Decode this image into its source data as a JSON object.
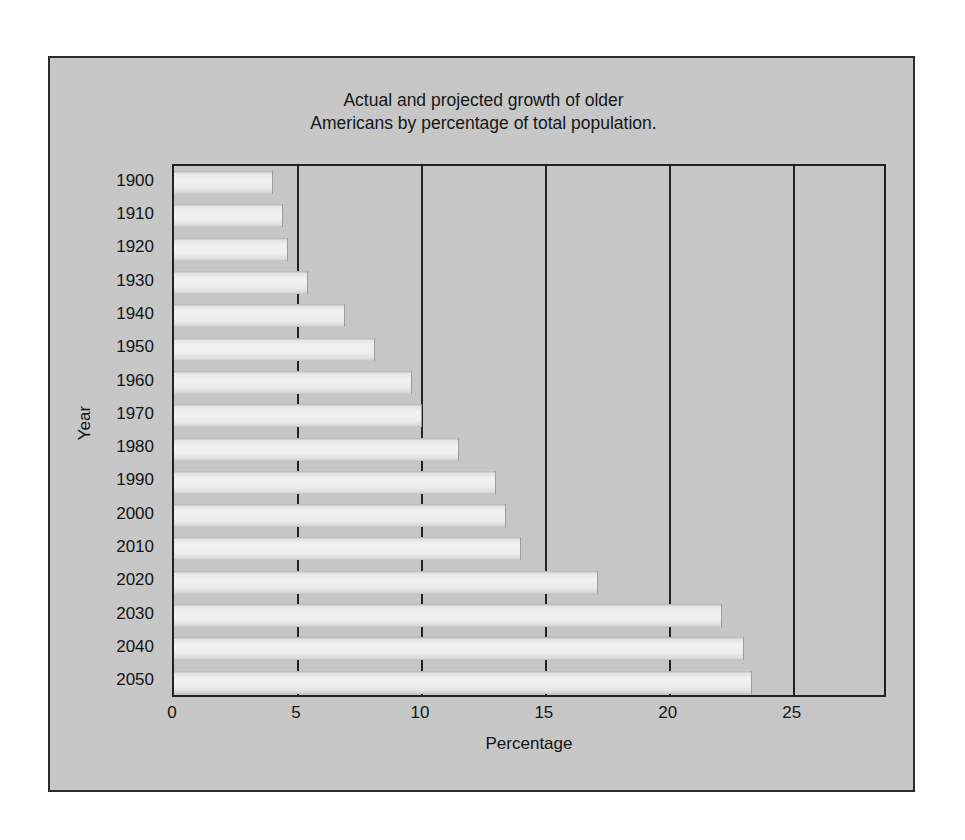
{
  "figure": {
    "title": "Actual and projected growth of older\nAmericans by percentage of total population.",
    "background_color": "#c9c9c9",
    "frame_color": "#2b2b2b",
    "bar_color": "#eeeeee"
  },
  "chart_data": {
    "type": "bar",
    "orientation": "horizontal",
    "title": "Actual and projected growth of older Americans by percentage of total population.",
    "xlabel": "Percentage",
    "ylabel": "Year",
    "categories": [
      "1900",
      "1910",
      "1920",
      "1930",
      "1940",
      "1950",
      "1960",
      "1970",
      "1980",
      "1990",
      "2000",
      "2010",
      "2020",
      "2030",
      "2040",
      "2050"
    ],
    "values": [
      4.0,
      4.4,
      4.6,
      5.4,
      6.9,
      8.1,
      9.6,
      10.0,
      11.5,
      13.0,
      13.4,
      14.0,
      17.1,
      22.1,
      23.0,
      23.3
    ],
    "xlim": [
      0,
      28.8
    ],
    "xticks": [
      0,
      5,
      10,
      15,
      20,
      25
    ],
    "xtick_labels": [
      "0",
      "5",
      "10",
      "15",
      "20",
      "25"
    ],
    "grid": "vertical",
    "legend": "none"
  }
}
